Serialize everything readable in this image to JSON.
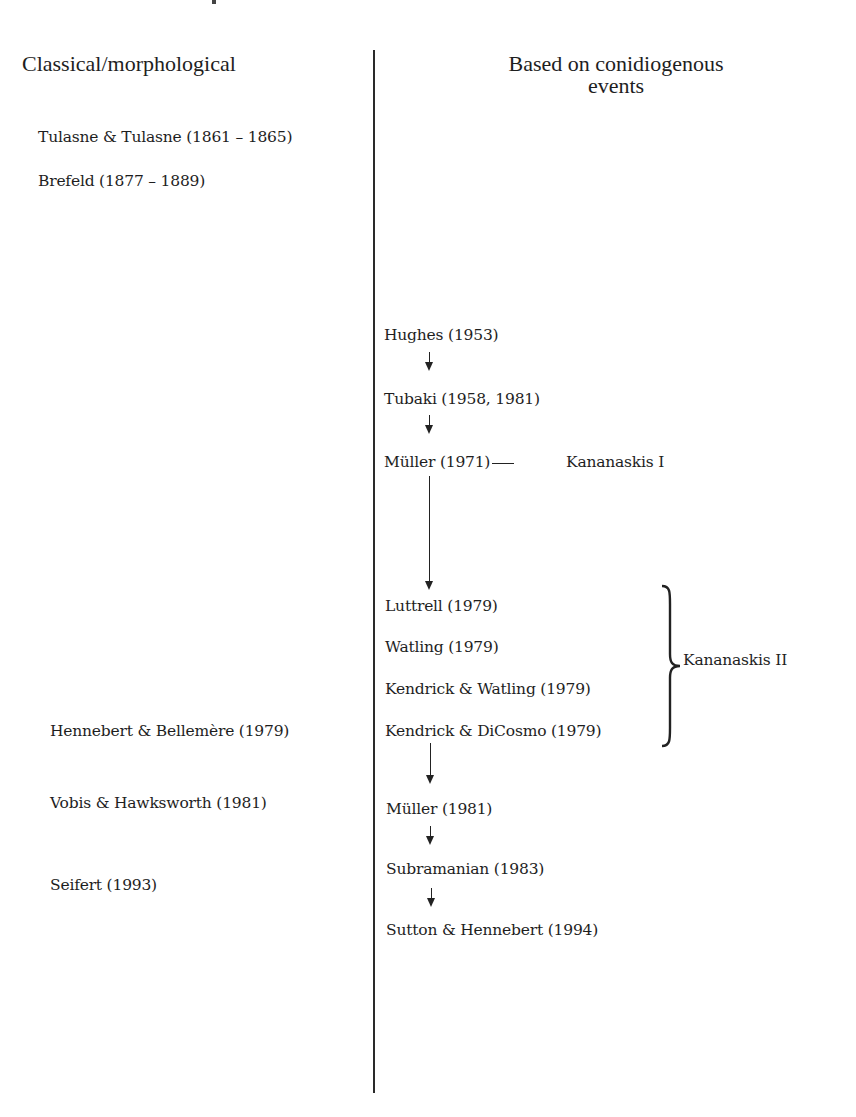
{
  "headers": {
    "left": "Classical/morphological",
    "right_line1": "Based on conidiogenous",
    "right_line2": "events"
  },
  "left_column": [
    "Tulasne & Tulasne (1861 – 1865)",
    "Brefeld (1877 – 1889)",
    "Hennebert & Bellemère (1979)",
    "Vobis & Hawksworth (1981)",
    "Seifert (1993)"
  ],
  "right_column": {
    "early": [
      "Hughes (1953)",
      "Tubaki (1958, 1981)",
      "Müller (1971)"
    ],
    "kananaskis_ii_group": [
      "Luttrell (1979)",
      "Watling (1979)",
      "Kendrick & Watling (1979)",
      "Kendrick & DiCosmo (1979)"
    ],
    "late": [
      "Müller (1981)",
      "Subramanian (1983)",
      "Sutton & Hennebert (1994)"
    ]
  },
  "annotations": {
    "kananaskis_i": "Kananaskis I",
    "kananaskis_ii": "Kananaskis II"
  }
}
